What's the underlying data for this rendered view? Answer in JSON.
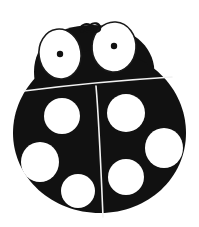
{
  "image": {
    "title": "Ladybug",
    "subject": "ladybug-line-art",
    "style": "black-and-white clip art silhouette",
    "background_color": "#ffffff",
    "body_color": "#111111",
    "spot_color": "#ffffff",
    "outline_color": "#1a1a1a",
    "line_color": "#f2f2f2",
    "canvas": {
      "width": 199,
      "height": 227
    }
  },
  "figure": {
    "body": {
      "name": "ladybug-body",
      "shape": "rounded-oval-shield",
      "center_x": 100,
      "center_y": 132,
      "radius_x": 87,
      "radius_y": 84,
      "fill": "#111111"
    },
    "head": {
      "name": "ladybug-head",
      "center_x": 88,
      "center_y": 56,
      "width": 118,
      "height": 62,
      "fill": "#111111"
    },
    "eyes": [
      {
        "name": "left-eye",
        "center_x": 60,
        "center_y": 54,
        "radius_x": 21,
        "radius_y": 25,
        "rotation_deg": -8,
        "fill": "#ffffff",
        "pupil": {
          "center_x": 60,
          "center_y": 54,
          "radius": 3.2,
          "fill": "#111111"
        }
      },
      {
        "name": "right-eye",
        "center_x": 114,
        "center_y": 47,
        "radius_x": 22,
        "radius_y": 25,
        "rotation_deg": 4,
        "fill": "#ffffff",
        "pupil": {
          "center_x": 114,
          "center_y": 46,
          "radius": 3.2,
          "fill": "#111111"
        }
      }
    ],
    "antennae": {
      "name": "antenna-squiggle",
      "center_x": 88,
      "center_y": 28,
      "description": "small coiled squiggle between the two eyes at top of head"
    },
    "wing_split": {
      "name": "wing-split-line",
      "x_top": 96,
      "y_top": 92,
      "x_bottom": 103,
      "y_bottom": 216,
      "stroke": "#f2f2f2",
      "stroke_width": 1.6
    },
    "pronotum_line": {
      "name": "pronotum-line",
      "x_start": 24,
      "y_start": 91,
      "x_end": 172,
      "y_end": 77,
      "stroke": "#f2f2f2",
      "stroke_width": 1.6
    },
    "spots": [
      {
        "name": "spot-upper-left",
        "center_x": 62,
        "center_y": 116,
        "radius_x": 18,
        "radius_y": 18,
        "fill": "#ffffff"
      },
      {
        "name": "spot-upper-right",
        "center_x": 126,
        "center_y": 113,
        "radius_x": 19,
        "radius_y": 19,
        "fill": "#ffffff"
      },
      {
        "name": "spot-mid-right",
        "center_x": 164,
        "center_y": 148,
        "radius_x": 19,
        "radius_y": 20,
        "fill": "#ffffff"
      },
      {
        "name": "spot-mid-left",
        "center_x": 40,
        "center_y": 162,
        "radius_x": 19,
        "radius_y": 20,
        "fill": "#ffffff"
      },
      {
        "name": "spot-lower-right",
        "center_x": 126,
        "center_y": 177,
        "radius_x": 18,
        "radius_y": 18,
        "fill": "#ffffff"
      },
      {
        "name": "spot-lower-left",
        "center_x": 78,
        "center_y": 191,
        "radius_x": 17,
        "radius_y": 17,
        "fill": "#ffffff"
      }
    ],
    "spot_count": 6
  }
}
